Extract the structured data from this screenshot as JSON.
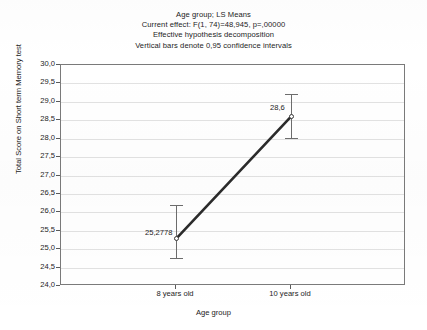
{
  "chart_data": {
    "type": "line",
    "title_lines": [
      "Age group; LS Means",
      "Current effect: F(1, 74)=48,945, p=,00000",
      "Effective hypothesis decomposition",
      "Vertical bars denote 0,95 confidence intervals"
    ],
    "xlabel": "Age group",
    "ylabel": "Total Score on Short term Memory test",
    "categories": [
      "8 years old",
      "10 years old"
    ],
    "values": [
      25.2778,
      28.6
    ],
    "point_labels": [
      "25,2778",
      "28,6"
    ],
    "error_low": [
      24.75,
      28.02
    ],
    "error_high": [
      26.2,
      29.2
    ],
    "ylim": [
      24.0,
      30.0
    ],
    "ytick_step": 0.5,
    "ytick_labels": [
      "30,0",
      "29,5",
      "29,0",
      "28,5",
      "28,0",
      "27,5",
      "27,0",
      "26,5",
      "26,0",
      "25,5",
      "25,0",
      "24,5",
      "24,0"
    ],
    "grid": true,
    "grid_axis": "y",
    "legend": null,
    "marker": "open-circle",
    "line_color": "#2b2b2b",
    "grid_color": "#e2e2e2",
    "axis_color": "#7a7a7a",
    "error_bar_color": "#6d6d6d",
    "background_color": "#ffffff",
    "text_color": "#1c1c1c"
  }
}
